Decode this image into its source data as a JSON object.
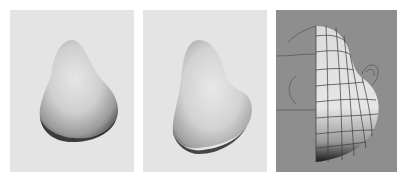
{
  "figure": {
    "panels": [
      {
        "id": "p1",
        "label": "Smooth shaded nose model - three-quarter view",
        "background": "#e4e4e4",
        "caption": ""
      },
      {
        "id": "p2",
        "label": "Smooth shaded nose model - side view",
        "background": "#e4e4e4",
        "caption": ""
      },
      {
        "id": "p3",
        "label": "Wireframe mesh half-nose model over reference curves",
        "background": "#8e8e8e",
        "caption": ""
      }
    ]
  }
}
